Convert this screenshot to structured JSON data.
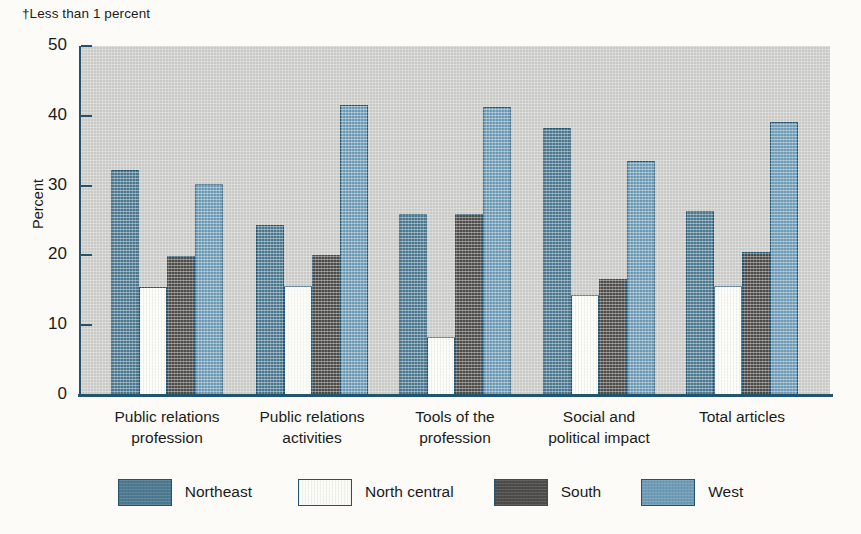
{
  "footnote": "†Less than 1 percent",
  "chart_data": {
    "type": "bar",
    "title": "",
    "xlabel": "",
    "ylabel": "Percent",
    "ylim": [
      0,
      50
    ],
    "yticks": [
      0,
      10,
      20,
      30,
      40,
      50
    ],
    "ytick_labels": [
      "0",
      "10",
      "20",
      "30",
      "40",
      "50"
    ],
    "grid": false,
    "legend_position": "bottom",
    "categories": [
      "Public relations profession",
      "Public relations activities",
      "Tools of the profession",
      "Social and political impact",
      "Total articles"
    ],
    "category_lines": [
      [
        "Public relations",
        "profession"
      ],
      [
        "Public relations",
        "activities"
      ],
      [
        "Tools of the",
        "profession"
      ],
      [
        "Social and",
        "political impact"
      ],
      [
        "Total articles"
      ]
    ],
    "series": [
      {
        "name": "Northeast",
        "color": "#4d7a91",
        "border": "#23536f",
        "values": [
          32.3,
          24.4,
          26.0,
          38.3,
          26.3
        ]
      },
      {
        "name": "North central",
        "color": "#fbfbf6",
        "border": "#23536f",
        "values": [
          15.5,
          15.6,
          8.3,
          14.3,
          15.6
        ]
      },
      {
        "name": "South",
        "color": "#4e4c49",
        "border": "#23536f",
        "values": [
          19.9,
          20.1,
          25.9,
          16.6,
          20.5
        ]
      },
      {
        "name": "West",
        "color": "#6e9cb6",
        "border": "#23536f",
        "values": [
          30.2,
          41.6,
          41.3,
          33.5,
          39.1
        ]
      }
    ]
  },
  "colors": {
    "plot_background": "#c9c9c6",
    "page_background": "#fcfbf7",
    "axis": "#23536f"
  }
}
